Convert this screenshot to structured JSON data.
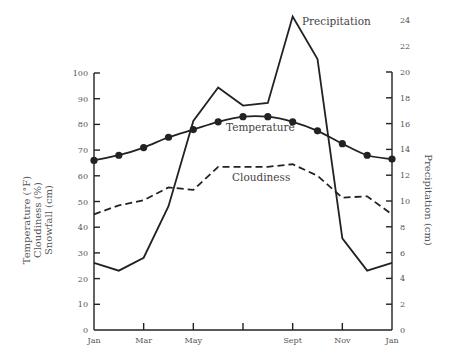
{
  "chart_data": {
    "type": "line",
    "title": "",
    "x": [
      "Jan",
      "Feb",
      "Mar",
      "Apr",
      "May",
      "Jun",
      "Jul",
      "Aug",
      "Sept",
      "Oct",
      "Nov",
      "Dec",
      "Jan"
    ],
    "x_tick_labels": [
      "Jan",
      "",
      "Mar",
      "",
      "May",
      "",
      "",
      "",
      "Sept",
      "",
      "Nov",
      "",
      "Jan"
    ],
    "xlabel": "",
    "ylabel_left": [
      "Temperature (°F)",
      "Cloudiness (%)",
      "Snowfall (cm)"
    ],
    "ylabel_right": "Precipitation (cm)",
    "ylim_left": [
      0,
      100
    ],
    "yticks_left": [
      0,
      10,
      20,
      30,
      40,
      50,
      60,
      70,
      80,
      90,
      100
    ],
    "ylim_right": [
      0,
      24
    ],
    "yticks_right": [
      0,
      2,
      4,
      6,
      8,
      10,
      12,
      14,
      16,
      18,
      20,
      22,
      24
    ],
    "grid": false,
    "legend": "inline labels",
    "series": [
      {
        "name": "Precipitation",
        "axis": "right",
        "unit": "cm",
        "style": "solid",
        "values": [
          5.2,
          4.6,
          5.6,
          9.6,
          16.2,
          18.8,
          17.4,
          17.6,
          24.3,
          21.0,
          7.1,
          4.6,
          5.2
        ]
      },
      {
        "name": "Temperature",
        "axis": "left",
        "unit": "°F",
        "style": "solid-with-markers",
        "values": [
          66,
          68,
          71,
          75,
          78,
          81,
          83,
          83,
          81,
          77.5,
          72.5,
          68,
          66.5
        ]
      },
      {
        "name": "Cloudiness",
        "axis": "left",
        "unit": "%",
        "style": "dashed",
        "values": [
          45,
          48.5,
          50.5,
          55.5,
          54.5,
          63.5,
          63.5,
          63.5,
          64.5,
          60,
          51.5,
          52,
          45
        ]
      }
    ],
    "annotations": [
      {
        "text": "Precipitation",
        "near": "Sept peak"
      },
      {
        "text": "Temperature",
        "near": "Jul-Aug"
      },
      {
        "text": "Cloudiness",
        "near": "Jul-Aug"
      }
    ]
  },
  "labels": {
    "precipitation": "Precipitation",
    "temperature": "Temperature",
    "cloudiness": "Cloudiness",
    "left_title_1": "Temperature (°F)",
    "left_title_2": "Cloudiness (%)",
    "left_title_3": "Snowfall (cm)",
    "right_title": "Precipitation (cm)"
  }
}
